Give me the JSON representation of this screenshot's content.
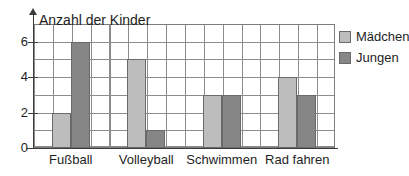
{
  "chart_data": {
    "type": "bar",
    "title": "Anzahl der Kinder",
    "xlabel": "",
    "ylabel": "",
    "categories": [
      "Fußball",
      "Volleyball",
      "Schwimmen",
      "Rad fahren"
    ],
    "series": [
      {
        "name": "Mädchen",
        "color": "#bdbdbd",
        "values": [
          2,
          5,
          3,
          4
        ]
      },
      {
        "name": "Jungen",
        "color": "#868686",
        "values": [
          6,
          1,
          3,
          3
        ]
      }
    ],
    "ylim": [
      0,
      7
    ],
    "ytick_labels": [
      "0",
      "2",
      "4",
      "6"
    ],
    "ytick_values": [
      0,
      2,
      4,
      6
    ],
    "grid": true,
    "grid_step_y": 1,
    "legend_position": "right"
  },
  "legend": {
    "items": [
      {
        "label": "Mädchen",
        "color": "#bdbdbd"
      },
      {
        "label": "Jungen",
        "color": "#868686"
      }
    ]
  },
  "axes": {
    "y_ticks": [
      {
        "label": "6",
        "value": 6
      },
      {
        "label": "4",
        "value": 4
      },
      {
        "label": "2",
        "value": 2
      },
      {
        "label": "0",
        "value": 0
      }
    ],
    "x_categories": [
      "Fußball",
      "Volleyball",
      "Schwimmen",
      "Rad fahren"
    ]
  }
}
